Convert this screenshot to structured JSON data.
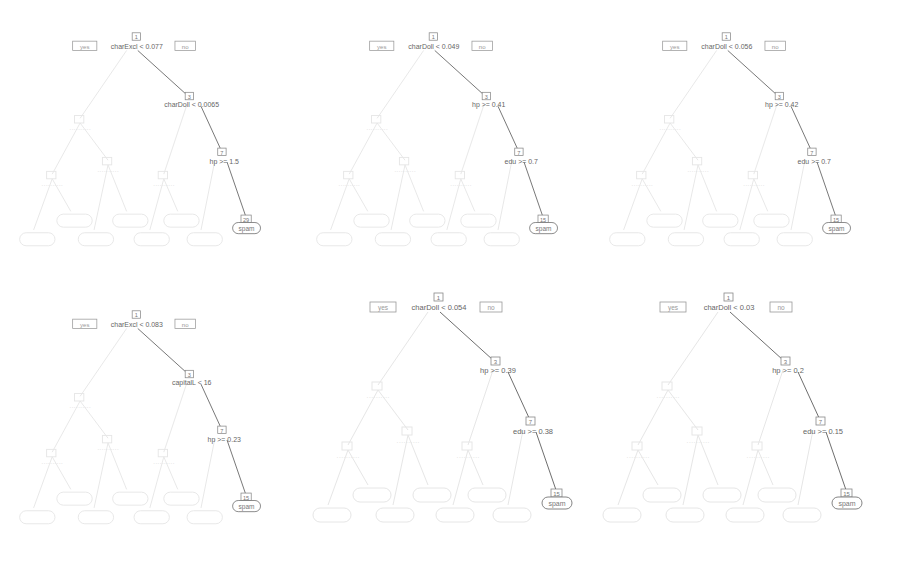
{
  "colors": {
    "highlight_edge": "#777777",
    "highlight_text": "#555555",
    "faded": "#e4e4e4",
    "faded_text": "#dddddd",
    "box": "#888888",
    "background": "#ffffff"
  },
  "trees": [
    {
      "id": "tree-1",
      "root_id": "1",
      "yes_label": "yes",
      "no_label": "no",
      "root_split": "charExcl < 0.077",
      "n2_id": "3",
      "n2_split": "charDoll < 0.0065",
      "n3_id": "7",
      "n3_split": "hp >= 1.5",
      "leaf_id": "29",
      "leaf_label": "spam"
    },
    {
      "id": "tree-2",
      "root_id": "1",
      "yes_label": "yes",
      "no_label": "no",
      "root_split": "charDoll < 0.049",
      "n2_id": "3",
      "n2_split": "hp >= 0.41",
      "n3_id": "7",
      "n3_split": "edu >= 0.7",
      "leaf_id": "15",
      "leaf_label": "spam"
    },
    {
      "id": "tree-3",
      "root_id": "1",
      "yes_label": "yes",
      "no_label": "no",
      "root_split": "charDoll < 0.056",
      "n2_id": "3",
      "n2_split": "hp >= 0.42",
      "n3_id": "7",
      "n3_split": "edu >= 0.7",
      "leaf_id": "15",
      "leaf_label": "spam"
    },
    {
      "id": "tree-4",
      "root_id": "1",
      "yes_label": "yes",
      "no_label": "no",
      "root_split": "charExcl < 0.083",
      "n2_id": "3",
      "n2_split": "capitalL < 16",
      "n3_id": "7",
      "n3_split": "hp >= 0.23",
      "leaf_id": "15",
      "leaf_label": "spam"
    },
    {
      "id": "tree-5",
      "root_id": "1",
      "yes_label": "yes",
      "no_label": "no",
      "root_split": "charDoll < 0.054",
      "n2_id": "3",
      "n2_split": "hp >= 0.39",
      "n3_id": "7",
      "n3_split": "edu >= 0.38",
      "leaf_id": "15",
      "leaf_label": "spam"
    },
    {
      "id": "tree-6",
      "root_id": "1",
      "yes_label": "yes",
      "no_label": "no",
      "root_split": "charDoll < 0.03",
      "n2_id": "3",
      "n2_split": "hp >= 0.2",
      "n3_id": "7",
      "n3_split": "edu >= 0.15",
      "leaf_id": "15",
      "leaf_label": "spam"
    }
  ]
}
